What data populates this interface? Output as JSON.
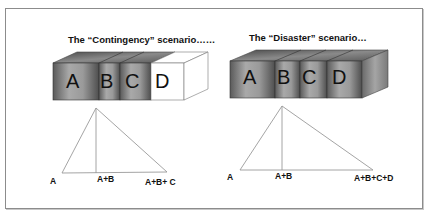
{
  "scenarios": [
    {
      "title": "The “Contingency” scenario……",
      "blocks": [
        {
          "label": "A",
          "state": "filled"
        },
        {
          "label": "B",
          "state": "filled"
        },
        {
          "label": "C",
          "state": "filled"
        },
        {
          "label": "D",
          "state": "empty"
        }
      ],
      "axis_labels": [
        "A",
        "A+B",
        "A+B+ C"
      ]
    },
    {
      "title": "The “Disaster” scenario…",
      "blocks": [
        {
          "label": "A",
          "state": "filled"
        },
        {
          "label": "B",
          "state": "filled"
        },
        {
          "label": "C",
          "state": "filled"
        },
        {
          "label": "D",
          "state": "filled"
        }
      ],
      "axis_labels": [
        "A",
        "A+B",
        "A+B+C+D"
      ]
    }
  ],
  "colors": {
    "block_dark": "#555555",
    "block_light": "#a8a8a8",
    "block_empty": "#ffffff",
    "line": "#9a9a9a",
    "frame": "#8c8c8c"
  }
}
